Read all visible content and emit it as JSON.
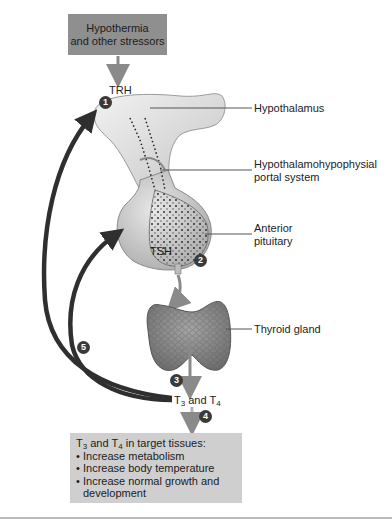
{
  "stimulus_box": {
    "line1": "Hypothermia",
    "line2": "and other stressors"
  },
  "labels": {
    "trh": "TRH",
    "tsh": "TSH",
    "t3_t4": {
      "t": "T",
      "sub3": "3",
      "and": " and ",
      "sub4": "4"
    },
    "hypothalamus": "Hypothalamus",
    "portal_system_line1": "Hypothalamohypophysial",
    "portal_system_line2": "portal system",
    "anterior_pituitary_line1": "Anterior",
    "anterior_pituitary_line2": "pituitary",
    "thyroid_gland": "Thyroid gland"
  },
  "steps": [
    "1",
    "2",
    "3",
    "4",
    "5"
  ],
  "effects_box": {
    "heading_prefix": "T",
    "heading_sub3": "3",
    "heading_and": " and T",
    "heading_sub4": "4",
    "heading_suffix": " in target tissues:",
    "items": [
      "Increase metabolism",
      "Increase body temperature",
      "Increase normal growth and"
    ],
    "item3_continuation": "development"
  },
  "colors": {
    "stimulus_box": "#8f8f8f",
    "effects_box": "#cfcfcf",
    "arrow_gray": "#8a8a8a",
    "feedback_arrow": "#2f2f2f",
    "number_badge": "#3a3a3a"
  }
}
